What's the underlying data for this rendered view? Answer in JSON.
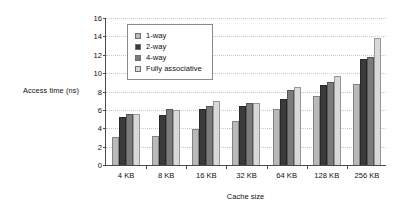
{
  "chart_data": {
    "type": "bar",
    "title": "",
    "xlabel": "Cache size",
    "ylabel": "Access time (ns)",
    "categories": [
      "4 KB",
      "8 KB",
      "16 KB",
      "32 KB",
      "64 KB",
      "128 KB",
      "256 KB"
    ],
    "series": [
      {
        "name": "1-way",
        "color": "#b9b9b9",
        "values": [
          3.1,
          3.15,
          3.95,
          4.8,
          6.15,
          7.5,
          8.85
        ]
      },
      {
        "name": "2-way",
        "color": "#3a3a3a",
        "values": [
          5.25,
          5.4,
          6.1,
          6.45,
          7.2,
          8.7,
          11.5
        ]
      },
      {
        "name": "4-way",
        "color": "#7b7b7b",
        "values": [
          5.6,
          6.05,
          6.4,
          6.7,
          8.2,
          9.0,
          11.75
        ]
      },
      {
        "name": "Fully associative",
        "color": "#d9d9d9",
        "values": [
          5.6,
          5.95,
          6.95,
          6.7,
          8.5,
          9.65,
          13.8
        ]
      }
    ],
    "ylim": [
      0,
      16
    ],
    "yticks": [
      0,
      2,
      4,
      6,
      8,
      10,
      12,
      14,
      16
    ],
    "grid": true,
    "legend_position": "top-left"
  }
}
